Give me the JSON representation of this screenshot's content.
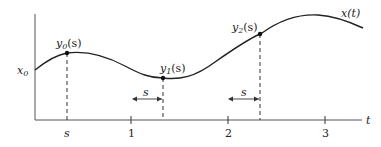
{
  "diagram": {
    "curve_label": "x(t)",
    "initial_value_label": "x",
    "initial_value_sub": "0",
    "x_axis_label": "t",
    "ticks": [
      {
        "label": "s",
        "italic": true
      },
      {
        "label": "1"
      },
      {
        "label": "2"
      },
      {
        "label": "3"
      }
    ],
    "points": [
      {
        "name": "y",
        "sub": "0",
        "arg": "(s)"
      },
      {
        "name": "y",
        "sub": "1",
        "arg": "(s)"
      },
      {
        "name": "y",
        "sub": "2",
        "arg": "(s)"
      }
    ],
    "shift_labels": [
      "s",
      "s"
    ],
    "colors": {
      "line": "#222222",
      "axis": "#555555",
      "text": "#222222"
    }
  }
}
